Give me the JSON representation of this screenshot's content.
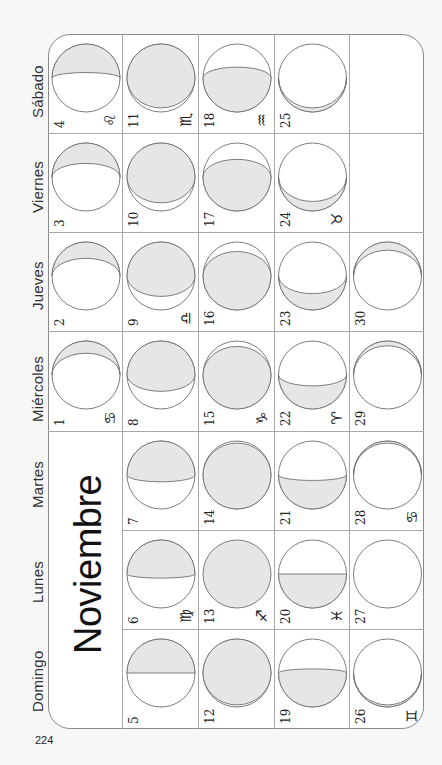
{
  "page": {
    "month_title": "Noviembre",
    "page_number": "224",
    "colors": {
      "moon_shade": "#e6e6e6",
      "stroke": "#6f6f6f",
      "grid": "#a8a8a8"
    }
  },
  "weekdays": [
    "Sábado",
    "Viernes",
    "Jueves",
    "Miércoles",
    "Martes",
    "Lunes",
    "Domingo"
  ],
  "weeks": [
    {
      "days": [
        {
          "weekday": "Sábado",
          "day": "4",
          "zodiac": "♌",
          "shade": "top",
          "fraction": 0.42
        },
        {
          "weekday": "Viernes",
          "day": "3",
          "zodiac": "",
          "shade": "top",
          "fraction": 0.3
        },
        {
          "weekday": "Jueves",
          "day": "2",
          "zodiac": "",
          "shade": "top",
          "fraction": 0.24
        },
        {
          "weekday": "Miércoles",
          "day": "1",
          "zodiac": "♋",
          "shade": "top",
          "fraction": 0.18
        }
      ]
    },
    {
      "days": [
        {
          "weekday": "Sábado",
          "day": "11",
          "zodiac": "♏",
          "shade": "top",
          "fraction": 0.94
        },
        {
          "weekday": "Viernes",
          "day": "10",
          "zodiac": "",
          "shade": "top",
          "fraction": 0.88
        },
        {
          "weekday": "Jueves",
          "day": "9",
          "zodiac": "♎",
          "shade": "top",
          "fraction": 0.8
        },
        {
          "weekday": "Miércoles",
          "day": "8",
          "zodiac": "",
          "shade": "top",
          "fraction": 0.74
        },
        {
          "weekday": "Martes",
          "day": "7",
          "zodiac": "",
          "shade": "top",
          "fraction": 0.6
        },
        {
          "weekday": "Lunes",
          "day": "6",
          "zodiac": "♍",
          "shade": "top",
          "fraction": 0.56
        },
        {
          "weekday": "Domingo",
          "day": "5",
          "zodiac": "",
          "shade": "top",
          "fraction": 0.5
        }
      ]
    },
    {
      "days": [
        {
          "weekday": "Sábado",
          "day": "18",
          "zodiac": "♒",
          "shade": "bottom",
          "fraction": 0.66
        },
        {
          "weekday": "Viernes",
          "day": "17",
          "zodiac": "",
          "shade": "bottom",
          "fraction": 0.76
        },
        {
          "weekday": "Jueves",
          "day": "16",
          "zodiac": "",
          "shade": "bottom",
          "fraction": 0.86
        },
        {
          "weekday": "Miércoles",
          "day": "15",
          "zodiac": "♑",
          "shade": "bottom",
          "fraction": 0.92
        },
        {
          "weekday": "Martes",
          "day": "14",
          "zodiac": "",
          "shade": "bottom",
          "fraction": 0.97
        },
        {
          "weekday": "Lunes",
          "day": "13",
          "zodiac": "♐",
          "shade": "top",
          "fraction": 1.0
        },
        {
          "weekday": "Domingo",
          "day": "12",
          "zodiac": "",
          "shade": "top",
          "fraction": 0.97
        }
      ]
    },
    {
      "days": [
        {
          "weekday": "Sábado",
          "day": "25",
          "zodiac": "",
          "shade": "bottom",
          "fraction": 0.06
        },
        {
          "weekday": "Viernes",
          "day": "24",
          "zodiac": "♉",
          "shade": "bottom",
          "fraction": 0.14
        },
        {
          "weekday": "Jueves",
          "day": "23",
          "zodiac": "",
          "shade": "bottom",
          "fraction": 0.24
        },
        {
          "weekday": "Miércoles",
          "day": "22",
          "zodiac": "♈",
          "shade": "bottom",
          "fraction": 0.34
        },
        {
          "weekday": "Martes",
          "day": "21",
          "zodiac": "",
          "shade": "bottom",
          "fraction": 0.42
        },
        {
          "weekday": "Lunes",
          "day": "20",
          "zodiac": "♓",
          "shade": "bottom",
          "fraction": 0.5
        },
        {
          "weekday": "Domingo",
          "day": "19",
          "zodiac": "",
          "shade": "bottom",
          "fraction": 0.56
        }
      ]
    },
    {
      "days": [
        {
          "weekday": "Sábado",
          "day": "",
          "zodiac": "",
          "shade": "none",
          "fraction": -1
        },
        {
          "weekday": "Viernes",
          "day": "",
          "zodiac": "",
          "shade": "none",
          "fraction": -1
        },
        {
          "weekday": "Jueves",
          "day": "30",
          "zodiac": "",
          "shade": "top",
          "fraction": 0.12
        },
        {
          "weekday": "Miércoles",
          "day": "29",
          "zodiac": "",
          "shade": "top",
          "fraction": 0.07
        },
        {
          "weekday": "Martes",
          "day": "28",
          "zodiac": "♋",
          "shade": "top",
          "fraction": 0.03
        },
        {
          "weekday": "Lunes",
          "day": "27",
          "zodiac": "",
          "shade": "none",
          "fraction": 0
        },
        {
          "weekday": "Domingo",
          "day": "26",
          "zodiac": "♊",
          "shade": "bottom",
          "fraction": 0.03
        }
      ]
    }
  ]
}
